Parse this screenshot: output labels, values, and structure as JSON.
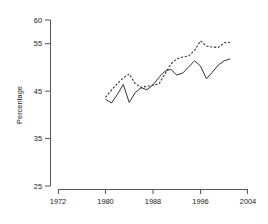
{
  "chart_data": {
    "type": "line",
    "title": "",
    "subtitle": "",
    "xlabel": "",
    "ylabel": "Percentage",
    "xlim": [
      1972,
      2004
    ],
    "ylim": [
      25,
      60
    ],
    "grid": false,
    "legend": "none",
    "x_ticks": [
      1972,
      1980,
      1988,
      1996,
      2004
    ],
    "y_ticks": [
      25,
      35,
      45,
      55,
      60
    ],
    "x": [
      1980,
      1981,
      1982,
      1983,
      1984,
      1985,
      1986,
      1987,
      1988,
      1989,
      1990,
      1991,
      1992,
      1993,
      1994,
      1995,
      1996,
      1997,
      1998,
      1999,
      2000,
      2001
    ],
    "series": [
      {
        "name": "solid-series",
        "style": "solid",
        "color": "#333333",
        "values": [
          43.3,
          42.5,
          44.3,
          46.4,
          42.6,
          44.7,
          45.7,
          45.3,
          46.3,
          47.9,
          49.2,
          49.6,
          48.4,
          48.8,
          50.1,
          51.4,
          50.3,
          47.6,
          49.0,
          50.5,
          51.4,
          51.8
        ]
      },
      {
        "name": "dashed-series",
        "style": "dashed",
        "color": "#333333",
        "values": [
          43.7,
          45.2,
          46.6,
          47.8,
          48.6,
          46.6,
          45.8,
          46.0,
          46.3,
          46.5,
          48.6,
          50.7,
          51.8,
          52.2,
          52.4,
          53.6,
          55.6,
          54.5,
          54.3,
          54.2,
          55.2,
          55.3
        ]
      }
    ]
  },
  "axes": {
    "y_axis_title": "Percentage",
    "y_tick_labels": [
      "60",
      "55",
      "45",
      "35",
      "25"
    ],
    "x_tick_labels": [
      "1972",
      "1980",
      "1988",
      "1996",
      "2004"
    ]
  }
}
